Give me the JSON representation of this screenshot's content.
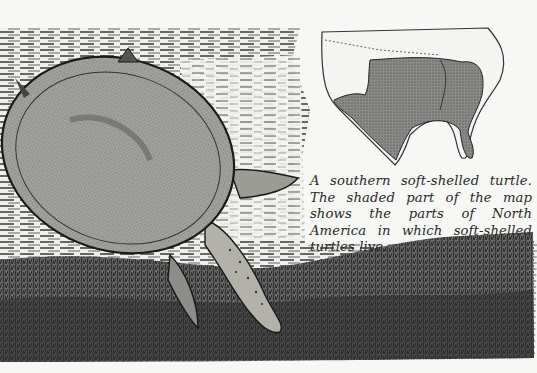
{
  "page": {
    "background_color": "#f7f7f5",
    "ink_color": "#1e1e1e"
  },
  "illustration": {
    "subject": "southern soft-shelled turtle swimming underwater",
    "elements": [
      "turtle-shell",
      "turtle-front-flipper",
      "turtle-rear-flipper",
      "turtle-head-neck",
      "water-hatching",
      "riverbed-grass"
    ]
  },
  "map": {
    "subject": "North America range map",
    "shaded_region": "soft-shelled turtle range",
    "shade_color": "#6e6e6e"
  },
  "caption": {
    "text": "A southern soft-shelled turtle. The shaded part of the map shows the parts of North America in which soft-shelled turtles live."
  }
}
